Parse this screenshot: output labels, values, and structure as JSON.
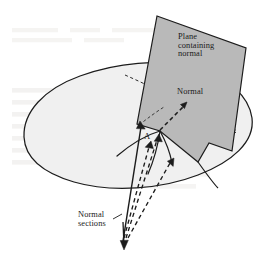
{
  "figure": {
    "labels": {
      "plane_containing_normal": "Plane\ncontaining\nnormal",
      "normal": "Normal",
      "normal_sections": "Normal\nsections",
      "point_a": "A"
    },
    "colors": {
      "background": "#ffffff",
      "surface_fill": "#f0f0f0",
      "plane_fill": "#b9b9b9",
      "outline": "#1c1c1c",
      "text": "#1a1a1a",
      "ghost_text": "#e6e4e1"
    },
    "geometry": {
      "surface_blob": "M 24,136 C 24,104 60,78 110,68 C 160,58 214,74 236,100 C 258,126 246,156 206,174 C 166,192 108,194 66,180 C 32,168 24,152 24,136 Z",
      "plane_quad": "M 157,16 L 246,47 L 232,150 L 208,144 L 196,161 L 137,131 Z",
      "normal_arrow": {
        "from": [
          160,
          131
        ],
        "to": [
          186,
          104
        ]
      },
      "section_apex": [
        160,
        131
      ],
      "sections_origin": [
        123,
        242
      ]
    },
    "elements": {
      "surface": "shaded-blob-surface",
      "plane": "shaded-cutting-plane",
      "dashed_hidden_edges": "hidden-surface-outline",
      "solid_section_curves": 3,
      "dashed_section_rays": 3
    }
  }
}
